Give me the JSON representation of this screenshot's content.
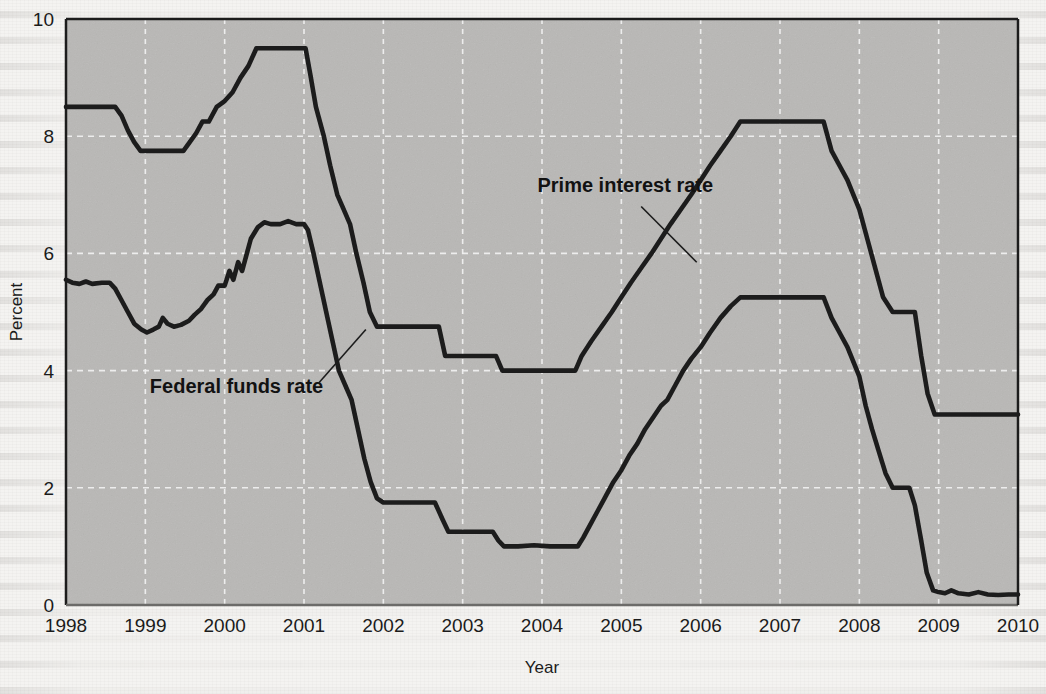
{
  "figure": {
    "plot_background_color": "#b9b8b6",
    "gridline_color": "#f2f2f2",
    "line_color": "#1c1c1c",
    "page_background_color": "#f4f3f1"
  },
  "labels": {
    "prime_series_label": "Prime interest rate",
    "fed_series_label": "Federal funds rate",
    "y_axis_title": "Percent",
    "x_axis_title": "Year"
  },
  "chart_data": {
    "type": "line",
    "title": "",
    "xlabel": "Year",
    "ylabel": "Percent",
    "xlim": [
      1998,
      2010
    ],
    "ylim": [
      0,
      10
    ],
    "grid": true,
    "legend_position": "inline-annotation",
    "x_tick_labels": [
      "1998",
      "1999",
      "2000",
      "2001",
      "2002",
      "2003",
      "2004",
      "2005",
      "2006",
      "2007",
      "2008",
      "2009",
      "2010"
    ],
    "y_tick_labels": [
      "0",
      "2",
      "4",
      "6",
      "8",
      "10"
    ],
    "x_ticks": [
      1998,
      1999,
      2000,
      2001,
      2002,
      2003,
      2004,
      2005,
      2006,
      2007,
      2008,
      2009,
      2010
    ],
    "y_ticks": [
      0,
      2,
      4,
      6,
      8,
      10
    ],
    "series": [
      {
        "name": "Prime interest rate",
        "color": "#1c1c1c",
        "points": [
          [
            1998.0,
            8.5
          ],
          [
            1998.2,
            8.5
          ],
          [
            1998.45,
            8.5
          ],
          [
            1998.62,
            8.5
          ],
          [
            1998.7,
            8.35
          ],
          [
            1998.78,
            8.1
          ],
          [
            1998.86,
            7.9
          ],
          [
            1998.94,
            7.75
          ],
          [
            1999.05,
            7.75
          ],
          [
            1999.25,
            7.75
          ],
          [
            1999.4,
            7.75
          ],
          [
            1999.48,
            7.75
          ],
          [
            1999.56,
            7.9
          ],
          [
            1999.64,
            8.05
          ],
          [
            1999.72,
            8.25
          ],
          [
            1999.8,
            8.25
          ],
          [
            1999.9,
            8.5
          ],
          [
            2000.0,
            8.6
          ],
          [
            2000.1,
            8.75
          ],
          [
            2000.2,
            9.0
          ],
          [
            2000.3,
            9.2
          ],
          [
            2000.4,
            9.5
          ],
          [
            2000.55,
            9.5
          ],
          [
            2000.75,
            9.5
          ],
          [
            2000.95,
            9.5
          ],
          [
            2001.02,
            9.5
          ],
          [
            2001.08,
            9.05
          ],
          [
            2001.15,
            8.5
          ],
          [
            2001.25,
            8.0
          ],
          [
            2001.33,
            7.5
          ],
          [
            2001.42,
            7.0
          ],
          [
            2001.5,
            6.75
          ],
          [
            2001.58,
            6.5
          ],
          [
            2001.66,
            6.0
          ],
          [
            2001.75,
            5.5
          ],
          [
            2001.83,
            5.0
          ],
          [
            2001.92,
            4.75
          ],
          [
            2002.0,
            4.75
          ],
          [
            2002.25,
            4.75
          ],
          [
            2002.5,
            4.75
          ],
          [
            2002.7,
            4.75
          ],
          [
            2002.78,
            4.25
          ],
          [
            2002.9,
            4.25
          ],
          [
            2003.05,
            4.25
          ],
          [
            2003.25,
            4.25
          ],
          [
            2003.42,
            4.25
          ],
          [
            2003.5,
            4.0
          ],
          [
            2003.7,
            4.0
          ],
          [
            2004.0,
            4.0
          ],
          [
            2004.25,
            4.0
          ],
          [
            2004.42,
            4.0
          ],
          [
            2004.5,
            4.25
          ],
          [
            2004.62,
            4.5
          ],
          [
            2004.75,
            4.75
          ],
          [
            2004.88,
            5.0
          ],
          [
            2005.0,
            5.25
          ],
          [
            2005.12,
            5.5
          ],
          [
            2005.25,
            5.75
          ],
          [
            2005.38,
            6.0
          ],
          [
            2005.5,
            6.25
          ],
          [
            2005.62,
            6.5
          ],
          [
            2005.75,
            6.75
          ],
          [
            2005.88,
            7.0
          ],
          [
            2006.0,
            7.25
          ],
          [
            2006.12,
            7.5
          ],
          [
            2006.25,
            7.75
          ],
          [
            2006.38,
            8.0
          ],
          [
            2006.5,
            8.25
          ],
          [
            2006.62,
            8.25
          ],
          [
            2006.9,
            8.25
          ],
          [
            2007.2,
            8.25
          ],
          [
            2007.45,
            8.25
          ],
          [
            2007.55,
            8.25
          ],
          [
            2007.65,
            7.75
          ],
          [
            2007.75,
            7.5
          ],
          [
            2007.85,
            7.25
          ],
          [
            2008.0,
            6.75
          ],
          [
            2008.1,
            6.25
          ],
          [
            2008.2,
            5.75
          ],
          [
            2008.3,
            5.25
          ],
          [
            2008.42,
            5.0
          ],
          [
            2008.6,
            5.0
          ],
          [
            2008.7,
            5.0
          ],
          [
            2008.78,
            4.25
          ],
          [
            2008.86,
            3.61
          ],
          [
            2008.95,
            3.25
          ],
          [
            2009.1,
            3.25
          ],
          [
            2009.4,
            3.25
          ],
          [
            2009.7,
            3.25
          ],
          [
            2010.0,
            3.25
          ]
        ]
      },
      {
        "name": "Federal funds rate",
        "color": "#1c1c1c",
        "points": [
          [
            1998.0,
            5.55
          ],
          [
            1998.08,
            5.5
          ],
          [
            1998.17,
            5.48
          ],
          [
            1998.25,
            5.52
          ],
          [
            1998.33,
            5.48
          ],
          [
            1998.45,
            5.5
          ],
          [
            1998.55,
            5.5
          ],
          [
            1998.62,
            5.4
          ],
          [
            1998.7,
            5.2
          ],
          [
            1998.78,
            5.0
          ],
          [
            1998.86,
            4.8
          ],
          [
            1998.95,
            4.7
          ],
          [
            1999.02,
            4.65
          ],
          [
            1999.1,
            4.7
          ],
          [
            1999.17,
            4.75
          ],
          [
            1999.22,
            4.9
          ],
          [
            1999.28,
            4.8
          ],
          [
            1999.36,
            4.75
          ],
          [
            1999.45,
            4.78
          ],
          [
            1999.55,
            4.85
          ],
          [
            1999.62,
            4.95
          ],
          [
            1999.7,
            5.05
          ],
          [
            1999.78,
            5.2
          ],
          [
            1999.86,
            5.3
          ],
          [
            1999.92,
            5.45
          ],
          [
            2000.0,
            5.45
          ],
          [
            2000.06,
            5.7
          ],
          [
            2000.11,
            5.55
          ],
          [
            2000.17,
            5.85
          ],
          [
            2000.22,
            5.7
          ],
          [
            2000.28,
            6.0
          ],
          [
            2000.33,
            6.25
          ],
          [
            2000.42,
            6.45
          ],
          [
            2000.5,
            6.53
          ],
          [
            2000.58,
            6.5
          ],
          [
            2000.7,
            6.5
          ],
          [
            2000.8,
            6.55
          ],
          [
            2000.9,
            6.5
          ],
          [
            2001.0,
            6.5
          ],
          [
            2001.05,
            6.4
          ],
          [
            2001.12,
            6.0
          ],
          [
            2001.2,
            5.5
          ],
          [
            2001.28,
            5.0
          ],
          [
            2001.36,
            4.5
          ],
          [
            2001.44,
            4.0
          ],
          [
            2001.52,
            3.75
          ],
          [
            2001.6,
            3.5
          ],
          [
            2001.68,
            3.0
          ],
          [
            2001.76,
            2.5
          ],
          [
            2001.84,
            2.1
          ],
          [
            2001.92,
            1.82
          ],
          [
            2002.0,
            1.75
          ],
          [
            2002.2,
            1.75
          ],
          [
            2002.45,
            1.75
          ],
          [
            2002.65,
            1.75
          ],
          [
            2002.75,
            1.45
          ],
          [
            2002.82,
            1.25
          ],
          [
            2002.95,
            1.25
          ],
          [
            2003.1,
            1.25
          ],
          [
            2003.25,
            1.25
          ],
          [
            2003.38,
            1.25
          ],
          [
            2003.45,
            1.1
          ],
          [
            2003.52,
            1.0
          ],
          [
            2003.7,
            1.0
          ],
          [
            2003.9,
            1.02
          ],
          [
            2004.1,
            1.0
          ],
          [
            2004.3,
            1.0
          ],
          [
            2004.45,
            1.0
          ],
          [
            2004.52,
            1.15
          ],
          [
            2004.6,
            1.35
          ],
          [
            2004.7,
            1.6
          ],
          [
            2004.8,
            1.85
          ],
          [
            2004.9,
            2.1
          ],
          [
            2005.0,
            2.3
          ],
          [
            2005.1,
            2.55
          ],
          [
            2005.2,
            2.75
          ],
          [
            2005.3,
            3.0
          ],
          [
            2005.4,
            3.2
          ],
          [
            2005.5,
            3.4
          ],
          [
            2005.58,
            3.5
          ],
          [
            2005.68,
            3.75
          ],
          [
            2005.78,
            4.0
          ],
          [
            2005.88,
            4.2
          ],
          [
            2006.0,
            4.4
          ],
          [
            2006.12,
            4.65
          ],
          [
            2006.25,
            4.9
          ],
          [
            2006.38,
            5.1
          ],
          [
            2006.5,
            5.25
          ],
          [
            2006.62,
            5.25
          ],
          [
            2006.9,
            5.25
          ],
          [
            2007.2,
            5.25
          ],
          [
            2007.45,
            5.25
          ],
          [
            2007.55,
            5.25
          ],
          [
            2007.65,
            4.9
          ],
          [
            2007.75,
            4.65
          ],
          [
            2007.85,
            4.4
          ],
          [
            2008.0,
            3.9
          ],
          [
            2008.08,
            3.4
          ],
          [
            2008.16,
            3.0
          ],
          [
            2008.25,
            2.6
          ],
          [
            2008.33,
            2.25
          ],
          [
            2008.42,
            2.0
          ],
          [
            2008.55,
            2.0
          ],
          [
            2008.63,
            2.0
          ],
          [
            2008.7,
            1.7
          ],
          [
            2008.78,
            1.1
          ],
          [
            2008.85,
            0.55
          ],
          [
            2008.93,
            0.25
          ],
          [
            2009.0,
            0.22
          ],
          [
            2009.08,
            0.2
          ],
          [
            2009.16,
            0.25
          ],
          [
            2009.25,
            0.2
          ],
          [
            2009.38,
            0.18
          ],
          [
            2009.5,
            0.22
          ],
          [
            2009.62,
            0.18
          ],
          [
            2009.75,
            0.17
          ],
          [
            2009.88,
            0.18
          ],
          [
            2010.0,
            0.18
          ]
        ]
      }
    ],
    "annotations": [
      {
        "text": "Prime interest rate",
        "text_x": 2005.05,
        "text_y": 7.05,
        "leader_from_x": 2005.25,
        "leader_from_y": 6.8,
        "leader_to_x": 2005.95,
        "leader_to_y": 5.85
      },
      {
        "text": "Federal funds rate",
        "text_x": 2000.15,
        "text_y": 3.62,
        "leader_from_x": 2001.18,
        "leader_from_y": 3.78,
        "leader_to_x": 2001.78,
        "leader_to_y": 4.7
      }
    ]
  }
}
